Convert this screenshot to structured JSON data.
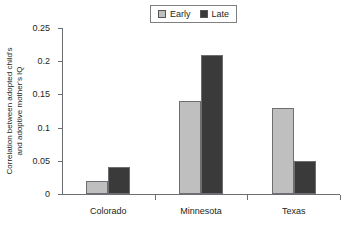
{
  "chart_data": {
    "type": "bar",
    "title": "",
    "subtitle": "",
    "xlabel": "",
    "ylabel": "Correlation between adopted child's and adoptive mother's IQ",
    "ylabel_lines": [
      "Correlation between adopted child's",
      "and adoptive mother's IQ"
    ],
    "categories": [
      "Colorado",
      "Minnesota",
      "Texas"
    ],
    "series": [
      {
        "name": "Early",
        "values": [
          0.02,
          0.14,
          0.13
        ],
        "color": "#bfbfbf"
      },
      {
        "name": "Late",
        "values": [
          0.04,
          0.21,
          0.05
        ],
        "color": "#3a3a3a"
      }
    ],
    "ylim": [
      0,
      0.25
    ],
    "ytick_values": [
      0,
      0.05,
      0.1,
      0.15,
      0.2,
      0.25
    ],
    "ytick_labels": [
      "0",
      "0.05",
      "0.1",
      "0.15",
      "0.2",
      "0.25"
    ],
    "grid": false,
    "legend_position": "top-center",
    "legend_entries": [
      "Early",
      "Late"
    ],
    "axis_color": "#6d6e71",
    "text_color": "#231f20",
    "background": "#ffffff"
  }
}
